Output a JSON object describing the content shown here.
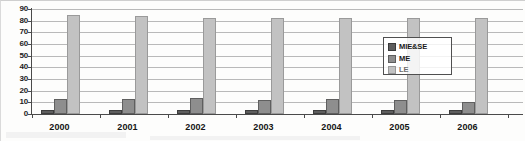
{
  "chart_data": {
    "type": "bar",
    "title": "",
    "xlabel": "",
    "ylabel": "",
    "ylim": [
      0,
      90
    ],
    "ytick_step": 10,
    "yticks": [
      90,
      80,
      70,
      60,
      50,
      40,
      30,
      20,
      10,
      0
    ],
    "grid": true,
    "legend_position": "upper-right-inside",
    "categories": [
      "2000",
      "2001",
      "2002",
      "2003",
      "2004",
      "2005",
      "2006"
    ],
    "series": [
      {
        "name": "MIE&SE",
        "color": "#5e5e5e",
        "values": [
          2,
          1.5,
          1.5,
          1.5,
          2,
          1.5,
          2
        ]
      },
      {
        "name": "ME",
        "color": "#8e8e8e",
        "values": [
          11,
          11,
          12,
          10,
          11,
          10,
          9
        ]
      },
      {
        "name": "LE",
        "color": "#c2c2c2",
        "values": [
          83,
          82,
          81,
          81,
          81,
          81,
          81
        ]
      }
    ],
    "note": "last category 2006 is clipped by the right edge of the image; only the first two series bars are visible"
  },
  "legend": {
    "items": [
      {
        "label": "MIE&SE"
      },
      {
        "label": "ME"
      },
      {
        "label": "LE"
      }
    ]
  },
  "colors": {
    "series_dark": "#5e5e5e",
    "series_mid": "#8e8e8e",
    "series_light": "#c2c2c2",
    "axis": "#4a4a4a",
    "gridline": "#b9b9b9",
    "background": "#fdfdfc"
  }
}
